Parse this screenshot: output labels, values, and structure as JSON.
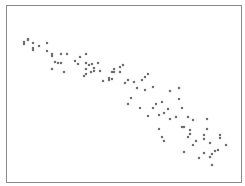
{
  "chart_data": {
    "type": "scatter",
    "title": "",
    "xlabel": "",
    "ylabel": "",
    "grid": false,
    "legend": null,
    "axis_ticks_visible": false,
    "marker": {
      "shape": "square",
      "size": 2.2,
      "color": "#6e6e6e"
    },
    "frame": {
      "color": "#8a8a8a"
    },
    "note": "Points given in pixel coordinates of the 245x186 image; no axis ticks are shown. Strong negative linear correlation.",
    "points": [
      [
        24,
        42
      ],
      [
        24,
        44
      ],
      [
        28,
        39
      ],
      [
        28,
        40
      ],
      [
        33,
        43
      ],
      [
        33,
        48
      ],
      [
        33,
        50
      ],
      [
        39,
        46
      ],
      [
        47,
        43
      ],
      [
        47,
        51
      ],
      [
        52,
        54
      ],
      [
        52,
        56
      ],
      [
        55,
        62
      ],
      [
        58,
        63
      ],
      [
        61,
        63
      ],
      [
        52,
        69
      ],
      [
        61,
        54
      ],
      [
        67,
        54
      ],
      [
        64,
        72
      ],
      [
        75,
        61
      ],
      [
        78,
        64
      ],
      [
        80,
        57
      ],
      [
        86,
        54
      ],
      [
        86,
        63
      ],
      [
        89,
        65
      ],
      [
        92,
        64
      ],
      [
        98,
        63
      ],
      [
        94,
        68
      ],
      [
        94,
        71
      ],
      [
        86,
        69
      ],
      [
        86,
        74
      ],
      [
        84,
        76
      ],
      [
        91,
        72
      ],
      [
        100,
        71
      ],
      [
        103,
        81
      ],
      [
        109,
        78
      ],
      [
        109,
        80
      ],
      [
        112,
        79
      ],
      [
        112,
        72
      ],
      [
        114,
        69
      ],
      [
        114,
        72
      ],
      [
        120,
        72
      ],
      [
        120,
        67
      ],
      [
        123,
        65
      ],
      [
        125,
        83
      ],
      [
        128,
        80
      ],
      [
        134,
        82
      ],
      [
        137,
        88
      ],
      [
        142,
        80
      ],
      [
        145,
        77
      ],
      [
        148,
        74
      ],
      [
        145,
        90
      ],
      [
        153,
        87
      ],
      [
        131,
        98
      ],
      [
        128,
        104
      ],
      [
        140,
        108
      ],
      [
        153,
        108
      ],
      [
        156,
        104
      ],
      [
        162,
        102
      ],
      [
        148,
        116
      ],
      [
        159,
        115
      ],
      [
        164,
        113
      ],
      [
        168,
        109
      ],
      [
        170,
        119
      ],
      [
        170,
        91
      ],
      [
        176,
        117
      ],
      [
        179,
        88
      ],
      [
        179,
        99
      ],
      [
        182,
        108
      ],
      [
        188,
        117
      ],
      [
        193,
        120
      ],
      [
        159,
        129
      ],
      [
        162,
        137
      ],
      [
        164,
        141
      ],
      [
        182,
        127
      ],
      [
        184,
        127
      ],
      [
        190,
        130
      ],
      [
        190,
        134
      ],
      [
        188,
        137
      ],
      [
        196,
        141
      ],
      [
        193,
        145
      ],
      [
        184,
        152
      ],
      [
        207,
        119
      ],
      [
        207,
        129
      ],
      [
        204,
        135
      ],
      [
        204,
        139
      ],
      [
        210,
        143
      ],
      [
        220,
        135
      ],
      [
        220,
        138
      ],
      [
        226,
        145
      ],
      [
        218,
        150
      ],
      [
        215,
        151
      ],
      [
        212,
        154
      ],
      [
        210,
        157
      ],
      [
        204,
        153
      ],
      [
        199,
        158
      ],
      [
        212,
        165
      ]
    ]
  }
}
